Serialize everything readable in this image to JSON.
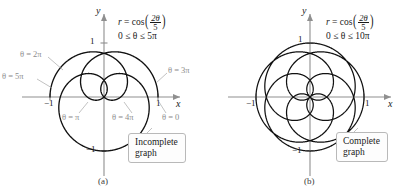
{
  "figure": {
    "caption_fragment": "",
    "background": "#ffffff",
    "curve_color": "#111111",
    "axis_color": "#8f8f8f",
    "leader_color": "#a8a8a8",
    "label_gray": "#8c8c8c"
  },
  "chart_data": {
    "type": "line",
    "coordinate_system": "polar",
    "equation_latex": "r = \\cos\\left(\\frac{2\\theta}{5}\\right)",
    "xlabel": "x",
    "ylabel": "y",
    "xlim": [
      -1.35,
      1.35
    ],
    "ylim": [
      -1.3,
      1.3
    ],
    "xticks": [
      -1,
      1
    ],
    "yticks": [
      -1,
      1
    ],
    "xticklabels": [
      "-1",
      "1"
    ],
    "yticklabels": [
      "-1",
      "1"
    ],
    "grid": false,
    "legend": false,
    "panels": [
      {
        "id": "a",
        "sublabel": "(a)",
        "theta_min": 0,
        "theta_max_over_pi": 5,
        "theta_range_text": "0 ≤ θ ≤ 5π",
        "status": "Incomplete graph",
        "samples": 1800
      },
      {
        "id": "b",
        "sublabel": "(b)",
        "theta_min": 0,
        "theta_max_over_pi": 10,
        "theta_range_text": "0 ≤ θ ≤ 10π",
        "status": "Complete graph",
        "samples": 3600
      }
    ]
  },
  "panel_a": {
    "sublabel": "(a)",
    "equation": {
      "lhs": "r",
      "equals": "=",
      "fn": "cos",
      "numerator": "2θ",
      "denominator": "5"
    },
    "domain_text": "0 ≤ θ ≤ 5π",
    "axis_x": "x",
    "axis_y": "y",
    "tick_x_neg": "−1",
    "tick_x_pos": "1",
    "tick_y_pos": "1",
    "tick_y_neg": "−1",
    "annotations": [
      {
        "name": "theta-2pi",
        "text": "θ = 2π"
      },
      {
        "name": "theta-5pi",
        "text": "θ = 5π"
      },
      {
        "name": "theta-3pi",
        "text": "θ = 3π"
      },
      {
        "name": "theta-pi",
        "text": "θ = π"
      },
      {
        "name": "theta-4pi",
        "text": "θ = 4π"
      },
      {
        "name": "theta-0",
        "text": "θ = 0"
      }
    ],
    "callout_line1": "Incomplete",
    "callout_line2": "graph"
  },
  "panel_b": {
    "sublabel": "(b)",
    "equation": {
      "lhs": "r",
      "equals": "=",
      "fn": "cos",
      "numerator": "2θ",
      "denominator": "5"
    },
    "domain_text": "0 ≤ θ ≤ 10π",
    "axis_x": "x",
    "axis_y": "y",
    "tick_x_neg": "−1",
    "tick_x_pos": "1",
    "tick_y_pos": "1",
    "tick_y_neg": "−1",
    "callout_line1": "Complete",
    "callout_line2": "graph"
  }
}
